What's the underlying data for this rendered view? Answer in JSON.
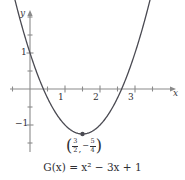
{
  "figure": {
    "caption_prefix": "G",
    "caption_var": "x",
    "caption_body": ") = ",
    "caption_full": "G(x) = x² − 3x + 1",
    "background": "#ffffff",
    "curve_color": "#4a4a52",
    "axis_color": "#8a8a8a",
    "text_color": "#2e2e33"
  },
  "axes": {
    "x_label": "x",
    "y_label": "y",
    "x_tick_labels": [
      "1",
      "2",
      "3"
    ],
    "y_tick_labels": [
      "1",
      "−1"
    ],
    "x_origin_px": 30,
    "y_origin_px": 89,
    "x_unit_px": 35,
    "y_unit_px": 36,
    "x_range": [
      -0.85,
      4.05
    ],
    "y_range": [
      -1.95,
      2.2
    ],
    "tick_step": 0.5,
    "grid": false
  },
  "annotation": {
    "open_paren": "(",
    "close_paren": ")",
    "comma": ",",
    "minus": "−",
    "x_num": "3",
    "x_den": "2",
    "y_num": "5",
    "y_den": "4",
    "vertex_x": 1.5,
    "vertex_y": -1.25
  },
  "chart_data": {
    "type": "line",
    "title": "",
    "subtitle": "",
    "xlabel": "x",
    "ylabel": "y",
    "xlim": [
      -0.85,
      4.05
    ],
    "ylim": [
      -1.95,
      2.2
    ],
    "grid": false,
    "legend": null,
    "function": "G(x) = x^2 - 3x + 1",
    "vertex": [
      1.5,
      -1.25
    ],
    "roots": [
      0.382,
      2.618
    ],
    "y_intercept": 1,
    "x_ticks": [
      1,
      2,
      3
    ],
    "y_ticks": [
      1,
      -1
    ],
    "series": [
      {
        "name": "G(x) = x² − 3x + 1",
        "x": [
          -0.45,
          -0.3,
          -0.15,
          0,
          0.15,
          0.3,
          0.45,
          0.6,
          0.75,
          0.9,
          1.05,
          1.2,
          1.35,
          1.5,
          1.65,
          1.8,
          1.95,
          2.1,
          2.25,
          2.4,
          2.55,
          2.7,
          2.85,
          3.0,
          3.15,
          3.3,
          3.45
        ],
        "y": [
          2.5525,
          1.99,
          1.4725,
          1.0,
          0.5725,
          0.19,
          -0.1475,
          -0.44,
          -0.6875,
          -0.89,
          -1.0475,
          -1.16,
          -1.2275,
          -1.25,
          -1.2275,
          -1.16,
          -1.0475,
          -0.89,
          -0.6875,
          -0.44,
          -0.1475,
          0.19,
          0.5725,
          1.0,
          1.4725,
          1.99,
          2.5525
        ]
      }
    ],
    "annotations": [
      {
        "text": "(3/2, -5/4)",
        "x": 1.5,
        "y": -1.25,
        "position": "below",
        "marker": "dot"
      }
    ]
  }
}
